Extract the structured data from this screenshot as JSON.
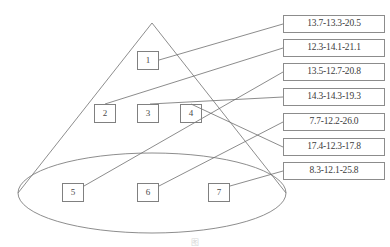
{
  "figure": {
    "caption": "图",
    "stroke_color": "#808080",
    "text_color": "#3c3c3c",
    "background": "#ffffff"
  },
  "cone": {
    "apex": {
      "x": 152,
      "y": 23
    },
    "base_ellipse": {
      "cx": 152,
      "cy": 193,
      "rx": 134,
      "ry": 40
    },
    "left_edge_label": "cone-left-edge",
    "right_edge_label": "cone-right-edge"
  },
  "nodes": [
    {
      "id": "1",
      "label": "1",
      "x": 137,
      "y": 51,
      "w": 22,
      "h": 19
    },
    {
      "id": "2",
      "label": "2",
      "x": 94,
      "y": 104,
      "w": 22,
      "h": 19
    },
    {
      "id": "3",
      "label": "3",
      "x": 137,
      "y": 104,
      "w": 22,
      "h": 19
    },
    {
      "id": "4",
      "label": "4",
      "x": 180,
      "y": 104,
      "w": 22,
      "h": 19
    },
    {
      "id": "5",
      "label": "5",
      "x": 62,
      "y": 183,
      "w": 22,
      "h": 19
    },
    {
      "id": "6",
      "label": "6",
      "x": 137,
      "y": 183,
      "w": 22,
      "h": 19
    },
    {
      "id": "7",
      "label": "7",
      "x": 208,
      "y": 183,
      "w": 22,
      "h": 19
    }
  ],
  "value_boxes": [
    {
      "index": 1,
      "text": "13.7-13.3-20.5",
      "x": 283,
      "y": 15,
      "w": 102,
      "h": 18
    },
    {
      "index": 2,
      "text": "12.3-14.1-21.1",
      "x": 283,
      "y": 39,
      "w": 102,
      "h": 18
    },
    {
      "index": 3,
      "text": "13.5-12.7-20.8",
      "x": 283,
      "y": 63,
      "w": 102,
      "h": 18
    },
    {
      "index": 4,
      "text": "14.3-14.3-19.3",
      "x": 283,
      "y": 88,
      "w": 102,
      "h": 18
    },
    {
      "index": 5,
      "text": "7.7-12.2-26.0",
      "x": 283,
      "y": 113,
      "w": 102,
      "h": 18
    },
    {
      "index": 6,
      "text": "17.4-12.3-17.8",
      "x": 283,
      "y": 138,
      "w": 102,
      "h": 18
    },
    {
      "index": 7,
      "text": "8.3-12.1-25.8",
      "x": 283,
      "y": 162,
      "w": 102,
      "h": 18
    }
  ],
  "connectors": [
    {
      "from_node": "1",
      "to_box": 1,
      "x1": 159,
      "y1": 60,
      "x2": 283,
      "y2": 24
    },
    {
      "from_node": "2",
      "to_box": 2,
      "x1": 105,
      "y1": 104,
      "x2": 283,
      "y2": 48
    },
    {
      "from_node": "5",
      "to_box": 3,
      "x1": 84,
      "y1": 186,
      "x2": 283,
      "y2": 72
    },
    {
      "from_node": "3",
      "to_box": 4,
      "x1": 150,
      "y1": 104,
      "x2": 283,
      "y2": 97
    },
    {
      "from_node": "6",
      "to_box": 5,
      "x1": 159,
      "y1": 186,
      "x2": 283,
      "y2": 122
    },
    {
      "from_node": "4",
      "to_box": 6,
      "x1": 191,
      "y1": 104,
      "x2": 283,
      "y2": 147
    },
    {
      "from_node": "7",
      "to_box": 7,
      "x1": 230,
      "y1": 186,
      "x2": 283,
      "y2": 171
    }
  ]
}
